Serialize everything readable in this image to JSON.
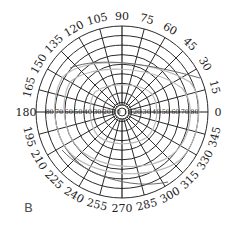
{
  "panel_label": "B",
  "chart_data": {
    "type": "polar",
    "title": "",
    "angular_ticks_deg": [
      0,
      15,
      30,
      45,
      60,
      75,
      90,
      105,
      120,
      135,
      150,
      165,
      180,
      195,
      210,
      225,
      240,
      255,
      270,
      285,
      300,
      315,
      330,
      345
    ],
    "radial_ticks": [
      10,
      20,
      30,
      40,
      50,
      60,
      70,
      80
    ],
    "radial_max": 90,
    "grid": true,
    "series": [
      {
        "name": "isopter-outer",
        "color": "#b8b8b8",
        "approx_extent_deg": {
          "0": 75,
          "90": 52,
          "180": 70,
          "270": 60
        }
      },
      {
        "name": "isopter-middle",
        "color": "#b8b8b8",
        "approx_extent_deg": {
          "0": 68,
          "90": 45,
          "180": 62,
          "270": 52
        }
      },
      {
        "name": "isopter-inner",
        "color": "#c4c4c4",
        "approx_extent_deg": {
          "0": 35,
          "90": 28,
          "180": 30,
          "270": 32
        }
      },
      {
        "name": "isopter-dark",
        "color": "#6a6a6a",
        "approx_extent_deg": {
          "0": 78,
          "90": 55,
          "180": 65,
          "270": 80
        }
      }
    ]
  }
}
